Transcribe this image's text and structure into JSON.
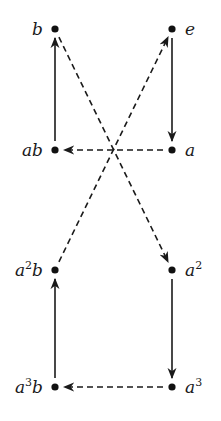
{
  "diagram": {
    "type": "cayley-graph",
    "nodes": [
      {
        "id": "b",
        "label": "b",
        "sup": "",
        "suffix": "",
        "x": 55,
        "y": 29,
        "label_side": "left"
      },
      {
        "id": "e",
        "label": "e",
        "sup": "",
        "suffix": "",
        "x": 172,
        "y": 29,
        "label_side": "right"
      },
      {
        "id": "ab",
        "label": "ab",
        "sup": "",
        "suffix": "",
        "x": 55,
        "y": 150,
        "label_side": "left"
      },
      {
        "id": "a",
        "label": "a",
        "sup": "",
        "suffix": "",
        "x": 172,
        "y": 150,
        "label_side": "right"
      },
      {
        "id": "a2b",
        "label": "a",
        "sup": "2",
        "suffix": "b",
        "x": 55,
        "y": 270,
        "label_side": "left"
      },
      {
        "id": "a2",
        "label": "a",
        "sup": "2",
        "suffix": "",
        "x": 172,
        "y": 270,
        "label_side": "right"
      },
      {
        "id": "a3b",
        "label": "a",
        "sup": "3",
        "suffix": "b",
        "x": 55,
        "y": 387,
        "label_side": "left"
      },
      {
        "id": "a3",
        "label": "a",
        "sup": "3",
        "suffix": "",
        "x": 172,
        "y": 387,
        "label_side": "right"
      }
    ],
    "edges": [
      {
        "from": "e",
        "to": "a",
        "style": "solid"
      },
      {
        "from": "a",
        "to": "ab",
        "style": "dashed"
      },
      {
        "from": "ab",
        "to": "b",
        "style": "solid"
      },
      {
        "from": "b",
        "to": "a2",
        "style": "dashed"
      },
      {
        "from": "a2",
        "to": "a3",
        "style": "solid"
      },
      {
        "from": "a3",
        "to": "a3b",
        "style": "dashed"
      },
      {
        "from": "a3b",
        "to": "a2b",
        "style": "solid"
      },
      {
        "from": "a2b",
        "to": "e",
        "style": "dashed"
      }
    ],
    "legend": {
      "solid": "multiplication by a",
      "dashed": "multiplication by b"
    }
  }
}
